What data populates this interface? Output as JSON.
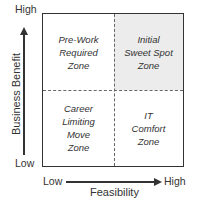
{
  "diagram": {
    "y_axis": {
      "title": "Business Benefit",
      "high": "High",
      "low": "Low"
    },
    "x_axis": {
      "title": "Feasibility",
      "low": "Low",
      "high": "High"
    },
    "quadrants": {
      "top_left": "Pre-Work\nRequired\nZone",
      "top_right": "Initial\nSweet Spot\nZone",
      "bottom_left": "Career\nLimiting\nMove\nZone",
      "bottom_right": "IT\nComfort\nZone"
    },
    "colors": {
      "highlight": "#ececec",
      "line": "#333333"
    }
  }
}
